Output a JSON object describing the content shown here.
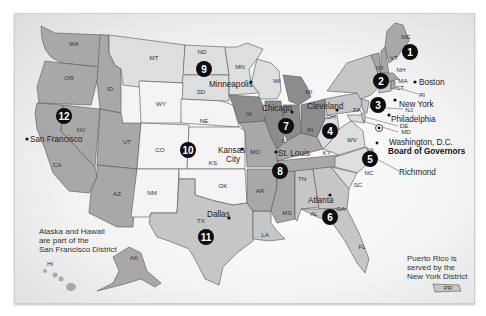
{
  "map": {
    "title": "Federal Reserve Districts",
    "districts": [
      {
        "number": "1",
        "city": "Boston"
      },
      {
        "number": "2",
        "city": "New York"
      },
      {
        "number": "3",
        "city": "Philadelphia"
      },
      {
        "number": "4",
        "city": "Cleveland"
      },
      {
        "number": "5",
        "city": "Richmond"
      },
      {
        "number": "6",
        "city": "Atlanta"
      },
      {
        "number": "7",
        "city": "Chicago"
      },
      {
        "number": "8",
        "city": "St. Louis"
      },
      {
        "number": "9",
        "city": "Minneapolis"
      },
      {
        "number": "10",
        "city": "Kansas City"
      },
      {
        "number": "11",
        "city": "Dallas"
      },
      {
        "number": "12",
        "city": "San Francisco"
      }
    ],
    "cities": {
      "boston": "Boston",
      "new_york": "New York",
      "philadelphia": "Philadelphia",
      "washington": "Washington, D.C.",
      "board": "Board of Governors",
      "richmond": "Richmond",
      "cleveland": "Cleveland",
      "chicago": "Chicago",
      "st_louis": "St. Louis",
      "minneapolis": "Minneapolis",
      "kansas": "Kansas",
      "city": "City",
      "dallas": "Dallas",
      "atlanta": "Atlanta",
      "san_francisco": "San Francisco"
    },
    "states": {
      "WA": "WA",
      "OR": "OR",
      "CA": "CA",
      "NV": "NV",
      "ID": "ID",
      "MT": "MT",
      "WY": "WY",
      "UT": "UT",
      "AZ": "AZ",
      "CO": "CO",
      "NM": "NM",
      "ND": "ND",
      "SD": "SD",
      "NE": "NE",
      "KS": "KS",
      "OK": "OK",
      "TX": "TX",
      "MN": "MN",
      "IA": "IA",
      "MO": "MO",
      "AR": "AR",
      "LA": "LA",
      "WI": "WI",
      "IL": "IL",
      "MI": "MI",
      "IN": "IN",
      "OH": "OH",
      "KY": "KY",
      "TN": "TN",
      "MS": "MS",
      "AL": "AL",
      "GA": "GA",
      "FL": "FL",
      "SC": "SC",
      "NC": "NC",
      "VA": "VA",
      "WV": "WV",
      "PA": "PA",
      "NY": "NY",
      "VT": "VT",
      "NH": "NH",
      "ME": "ME",
      "MA": "MA",
      "CT": "CT",
      "RI": "RI",
      "NJ": "NJ",
      "DE": "DE",
      "MD": "MD",
      "AK": "AK",
      "HI": "HI",
      "PR": "PR"
    },
    "notes": {
      "alaska_hawaii": [
        "Alaska and Hawaii",
        "are part of the",
        "San Francisco District"
      ],
      "puerto_rico": [
        "Puerto Rico is",
        "served by the",
        "New York District"
      ]
    }
  }
}
